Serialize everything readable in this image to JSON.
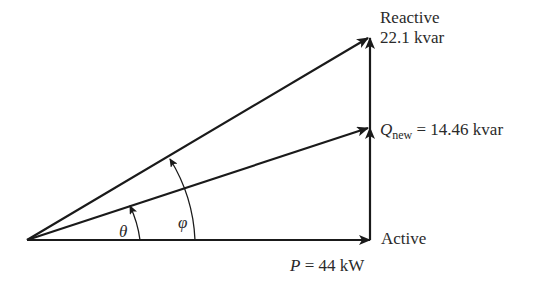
{
  "diagram": {
    "type": "power-triangle",
    "labels": {
      "reactive_title": "Reactive",
      "reactive_value": "22.1 kvar",
      "q_new_symbol": "Q",
      "q_new_subscript": "new",
      "q_new_value": "= 14.46 kvar",
      "active_title": "Active",
      "p_symbol": "P",
      "p_value": "= 44 kW",
      "theta": "θ",
      "phi": "φ"
    },
    "values": {
      "P_kW": 44,
      "Q_old_kvar": 22.1,
      "Q_new_kvar": 14.46
    },
    "colors": {
      "line": "#1a1a1a",
      "text": "#2a2a2a"
    }
  }
}
